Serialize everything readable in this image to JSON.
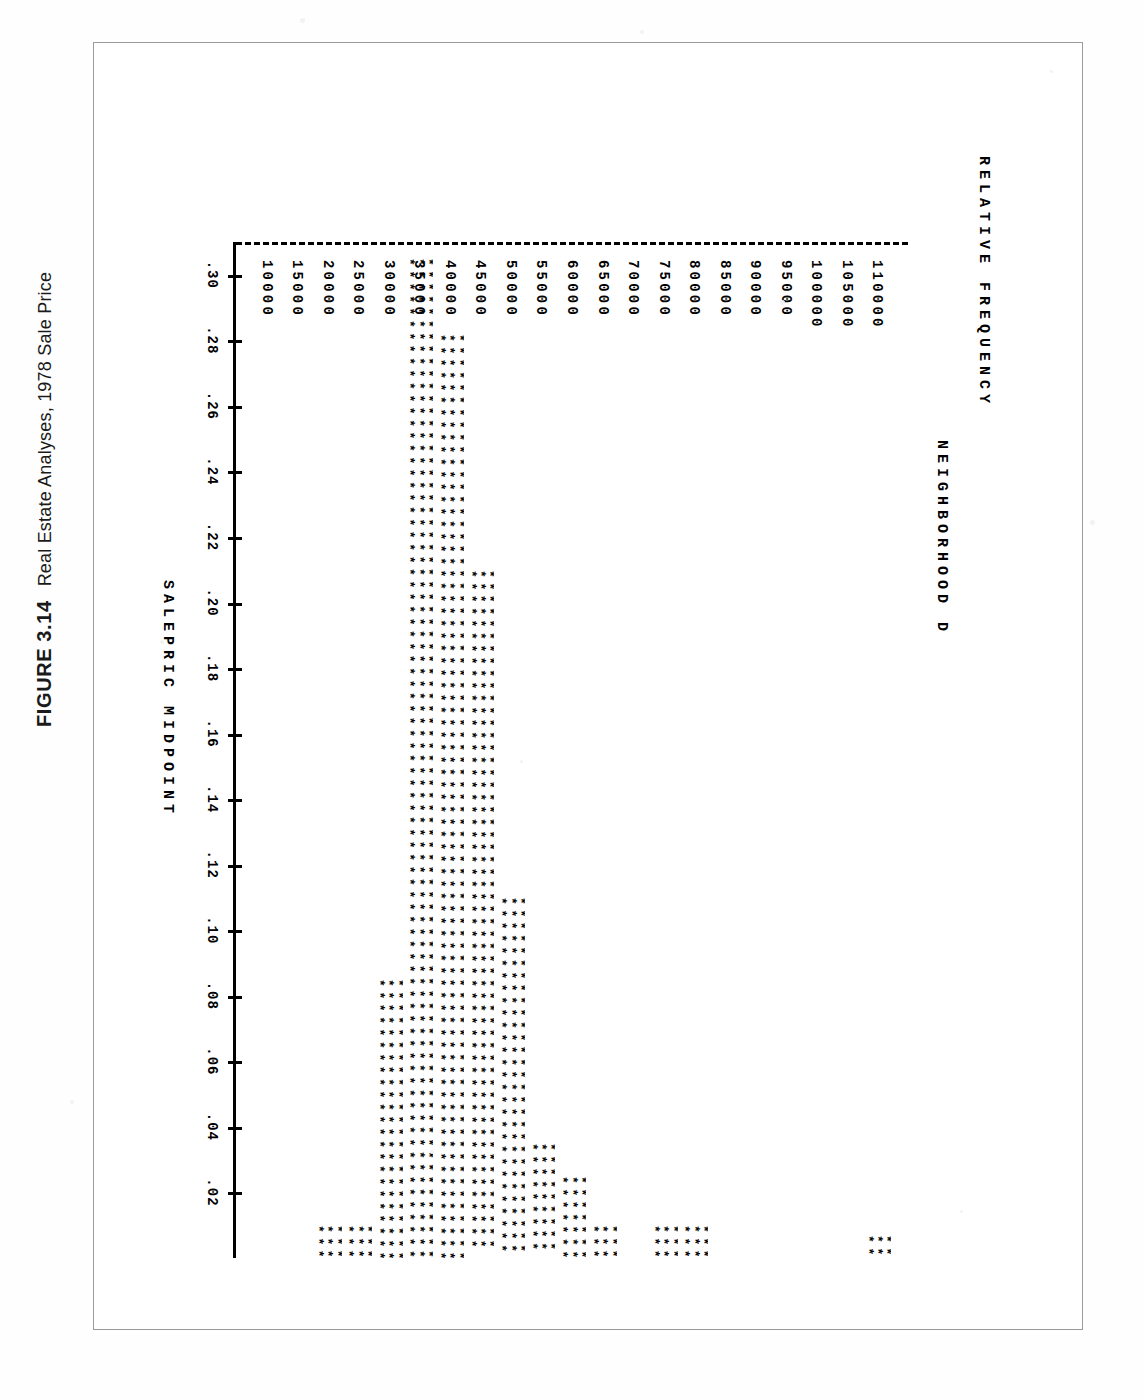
{
  "caption": {
    "figure_number": "FIGURE 3.14",
    "title": "Real Estate Analyses, 1978 Sale Price"
  },
  "chart_data": {
    "type": "bar",
    "orientation": "horizontal",
    "title": "NEIGHBORHOOD D",
    "xlabel": "SALEPRIC MIDPOINT",
    "ylabel": "RELATIVE FREQUENCY",
    "grid": false,
    "legend": null,
    "categories": [
      "10000",
      "15000",
      "20000",
      "25000",
      "30000",
      "35000",
      "40000",
      "45000",
      "50000",
      "55000",
      "60000",
      "65000",
      "70000",
      "75000",
      "80000",
      "85000",
      "90000",
      "95000",
      "100000",
      "105000",
      "110000"
    ],
    "values": [
      0.0,
      0.0,
      0.01,
      0.01,
      0.085,
      0.305,
      0.282,
      0.21,
      0.11,
      0.035,
      0.025,
      0.01,
      0.0,
      0.01,
      0.01,
      0.0,
      0.0,
      0.0,
      0.0,
      0.0,
      0.007
    ],
    "value_axis_ticks": [
      ".02",
      ".04",
      ".06",
      ".08",
      ".10",
      ".12",
      ".14",
      ".16",
      ".18",
      ".20",
      ".22",
      ".24",
      ".26",
      ".28",
      ".30"
    ],
    "value_axis_tick_values": [
      0.02,
      0.04,
      0.06,
      0.08,
      0.1,
      0.12,
      0.14,
      0.16,
      0.18,
      0.2,
      0.22,
      0.24,
      0.26,
      0.28,
      0.3
    ],
    "ylim": [
      0.0,
      0.31
    ],
    "marker": "*",
    "bar_rows": 3
  },
  "colors": {
    "ink": "#000000",
    "frame": "#9a9a9a",
    "paper": "#ffffff"
  }
}
